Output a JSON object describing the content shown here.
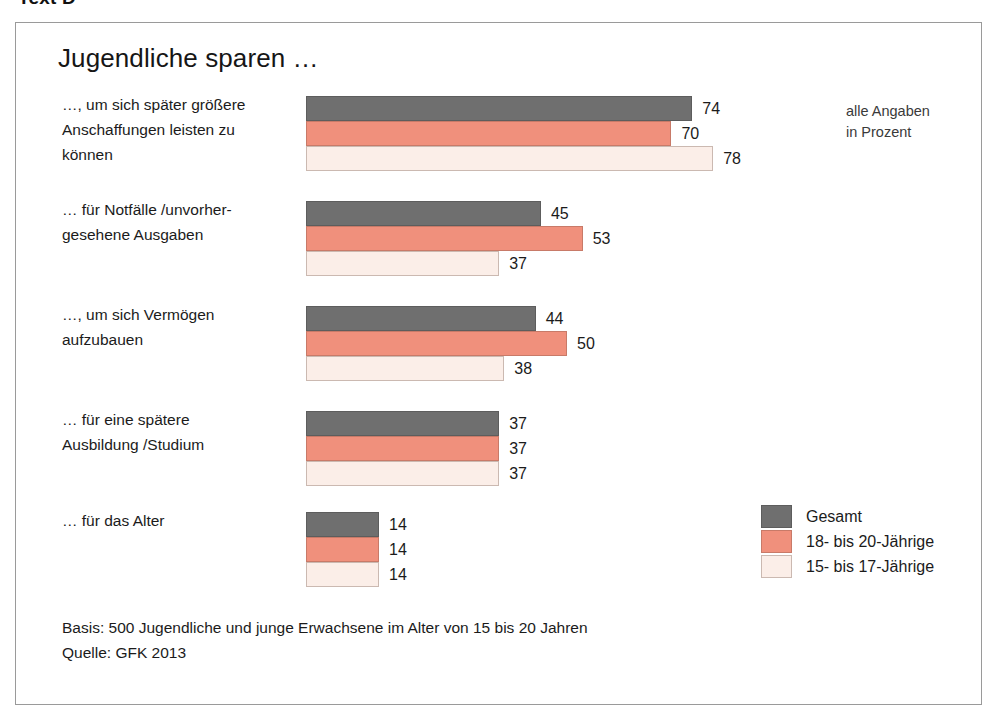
{
  "page": {
    "caption": "Text D"
  },
  "chart": {
    "title": "Jugendliche sparen …",
    "units_note_line1": "alle Angaben",
    "units_note_line2": "in Prozent",
    "footer_line1": "Basis: 500 Jugendliche und junge Erwachsene im Alter von 15 bis 20 Jahren",
    "footer_line2": "Quelle: GFK 2013",
    "colors": {
      "series_gesamt": "#6f6f6f",
      "series_18_20": "#f0907c",
      "series_15_17": "#fbeee8",
      "frame_border": "#9a9a9a",
      "text": "#1b1b1b"
    }
  },
  "chart_data": {
    "type": "bar",
    "orientation": "horizontal",
    "title": "Jugendliche sparen …",
    "subtitle": "alle Angaben in Prozent",
    "xlabel": "",
    "ylabel": "",
    "xlim": [
      0,
      80
    ],
    "grid": false,
    "legend_position": "bottom-right",
    "value_unit": "%",
    "categories": [
      "…, um sich später größere Anschaffungen leisten zu können",
      "… für Notfälle /unvorher-gesehene Ausgaben",
      "…, um sich Vermögen aufzubauen",
      "… für eine spätere Ausbildung /Studium",
      "… für das Alter"
    ],
    "series": [
      {
        "name": "Gesamt",
        "color": "#6f6f6f",
        "values": [
          74,
          45,
          44,
          37,
          14
        ]
      },
      {
        "name": "18- bis 20-Jährige",
        "color": "#f0907c",
        "values": [
          70,
          53,
          50,
          37,
          14
        ]
      },
      {
        "name": "15- bis 17-Jährige",
        "color": "#fbeee8",
        "values": [
          78,
          37,
          38,
          37,
          14
        ]
      }
    ],
    "groups": [
      {
        "label_lines": [
          "…, um sich später größere",
          "Anschaffungen leisten zu",
          "können"
        ],
        "bars": [
          {
            "series": "Gesamt",
            "value": 74,
            "label": "74"
          },
          {
            "series": "18- bis 20-Jährige",
            "value": 70,
            "label": "70"
          },
          {
            "series": "15- bis 17-Jährige",
            "value": 78,
            "label": "78"
          }
        ]
      },
      {
        "label_lines": [
          "… für Notfälle /unvorher-",
          "gesehene Ausgaben"
        ],
        "bars": [
          {
            "series": "Gesamt",
            "value": 45,
            "label": "45"
          },
          {
            "series": "18- bis 20-Jährige",
            "value": 53,
            "label": "53"
          },
          {
            "series": "15- bis 17-Jährige",
            "value": 37,
            "label": "37"
          }
        ]
      },
      {
        "label_lines": [
          "…, um sich Vermögen",
          "aufzubauen"
        ],
        "bars": [
          {
            "series": "Gesamt",
            "value": 44,
            "label": "44"
          },
          {
            "series": "18- bis 20-Jährige",
            "value": 50,
            "label": "50"
          },
          {
            "series": "15- bis 17-Jährige",
            "value": 38,
            "label": "38"
          }
        ]
      },
      {
        "label_lines": [
          "… für eine spätere",
          "Ausbildung /Studium"
        ],
        "bars": [
          {
            "series": "Gesamt",
            "value": 37,
            "label": "37"
          },
          {
            "series": "18- bis 20-Jährige",
            "value": 37,
            "label": "37"
          },
          {
            "series": "15- bis 17-Jährige",
            "value": 37,
            "label": "37"
          }
        ]
      },
      {
        "label_lines": [
          "… für das Alter"
        ],
        "bars": [
          {
            "series": "Gesamt",
            "value": 14,
            "label": "14"
          },
          {
            "series": "18- bis 20-Jährige",
            "value": 14,
            "label": "14"
          },
          {
            "series": "15- bis 17-Jährige",
            "value": 14,
            "label": "14"
          }
        ]
      }
    ],
    "legend": [
      {
        "name": "Gesamt",
        "color": "#6f6f6f"
      },
      {
        "name": "18- bis 20-Jährige",
        "color": "#f0907c"
      },
      {
        "name": "15- bis 17-Jährige",
        "color": "#fbeee8"
      }
    ]
  }
}
